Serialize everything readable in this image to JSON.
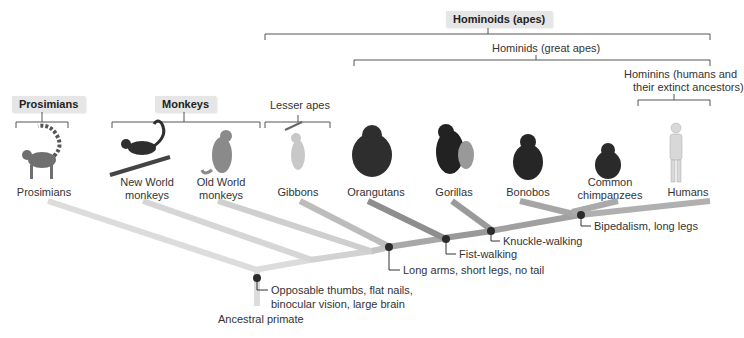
{
  "groups": {
    "hominoids": "Hominoids (apes)",
    "hominids": "Hominids (great apes)",
    "hominins_line1": "Hominins (humans and",
    "hominins_line2": "their extinct ancestors)",
    "lesser_apes": "Lesser apes",
    "prosimians": "Prosimians",
    "monkeys": "Monkeys"
  },
  "taxa": [
    {
      "line1": "Prosimians",
      "line2": ""
    },
    {
      "line1": "New World",
      "line2": "monkeys"
    },
    {
      "line1": "Old World",
      "line2": "monkeys"
    },
    {
      "line1": "Gibbons",
      "line2": ""
    },
    {
      "line1": "Orangutans",
      "line2": ""
    },
    {
      "line1": "Gorillas",
      "line2": ""
    },
    {
      "line1": "Bonobos",
      "line2": ""
    },
    {
      "line1": "Common",
      "line2": "chimpanzees"
    },
    {
      "line1": "Humans",
      "line2": ""
    }
  ],
  "traits": [
    {
      "line1": "Opposable thumbs, flat nails,",
      "line2": "binocular vision, large brain"
    },
    {
      "line1": "Long arms, short legs, no tail",
      "line2": ""
    },
    {
      "line1": "Fist-walking",
      "line2": ""
    },
    {
      "line1": "Knuckle-walking",
      "line2": ""
    },
    {
      "line1": "Bipedalism, long legs",
      "line2": ""
    }
  ],
  "root": "Ancestral primate",
  "colors": {
    "light_branch": "#dcdcdc",
    "mid_branch": "#b4b4b4",
    "dark_branch": "#8e8e8e",
    "node": "#2b2b2b",
    "bracket": "#555555",
    "group_box_bg": "#e6e6e6"
  }
}
